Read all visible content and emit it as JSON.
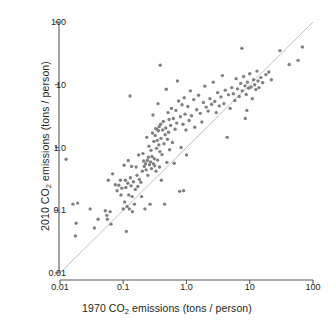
{
  "chart_data": {
    "type": "scatter",
    "title": "",
    "xlabel": "1970 CO2 emissions (tons / person)",
    "ylabel": "2010 CO2 emissions (tons / person)",
    "xlabel_parts": {
      "prefix": "1970 CO",
      "sub": "2",
      "suffix": " emissions (tons / person)"
    },
    "ylabel_parts": {
      "prefix": "2010 CO",
      "sub": "2",
      "suffix": " emissions (tons / person)"
    },
    "xscale": "log",
    "yscale": "log",
    "xlim": [
      0.01,
      100
    ],
    "ylim": [
      0.01,
      100
    ],
    "grid": false,
    "legend": null,
    "xticks": [
      "0.01",
      "0.1",
      "1.0",
      "10",
      "100"
    ],
    "xtick_values": [
      0.01,
      0.1,
      1.0,
      10,
      100
    ],
    "yticks": [
      "0.01",
      "0.1",
      "1.0",
      "10",
      "100"
    ],
    "ytick_values": [
      0.01,
      0.1,
      1.0,
      10,
      100
    ],
    "annotations": [
      {
        "name": "identity-line",
        "description": "y = x reference line",
        "from": [
          0.01,
          0.01
        ],
        "to": [
          100,
          100
        ],
        "color": "#b9b9b9"
      }
    ],
    "marker": {
      "shape": "circle",
      "color": "#808080",
      "size_px": 3.4
    },
    "point_count": 178,
    "points": [
      [
        0.0125,
        0.65
      ],
      [
        0.016,
        0.125
      ],
      [
        0.019,
        0.13
      ],
      [
        0.018,
        0.062
      ],
      [
        0.0175,
        0.039
      ],
      [
        0.03,
        0.105
      ],
      [
        0.035,
        0.052
      ],
      [
        0.04,
        0.072
      ],
      [
        0.052,
        0.098
      ],
      [
        0.055,
        0.083
      ],
      [
        0.056,
        0.072
      ],
      [
        0.058,
        0.3
      ],
      [
        0.062,
        0.095
      ],
      [
        0.064,
        0.06
      ],
      [
        0.068,
        0.38
      ],
      [
        0.075,
        0.255
      ],
      [
        0.08,
        0.205
      ],
      [
        0.085,
        0.25
      ],
      [
        0.09,
        0.3
      ],
      [
        0.092,
        0.175
      ],
      [
        0.095,
        0.225
      ],
      [
        0.1,
        0.105
      ],
      [
        0.103,
        0.52
      ],
      [
        0.105,
        0.135
      ],
      [
        0.108,
        0.3
      ],
      [
        0.11,
        0.23
      ],
      [
        0.112,
        0.046
      ],
      [
        0.115,
        0.115
      ],
      [
        0.118,
        0.27
      ],
      [
        0.12,
        0.62
      ],
      [
        0.122,
        0.175
      ],
      [
        0.125,
        0.105
      ],
      [
        0.128,
        6.6
      ],
      [
        0.13,
        0.33
      ],
      [
        0.133,
        0.245
      ],
      [
        0.135,
        0.5
      ],
      [
        0.138,
        0.165
      ],
      [
        0.14,
        0.095
      ],
      [
        0.145,
        0.285
      ],
      [
        0.15,
        0.125
      ],
      [
        0.155,
        0.215
      ],
      [
        0.16,
        0.49
      ],
      [
        0.165,
        0.36
      ],
      [
        0.17,
        0.24
      ],
      [
        0.175,
        0.76
      ],
      [
        0.18,
        0.31
      ],
      [
        0.19,
        0.28
      ],
      [
        0.195,
        0.165
      ],
      [
        0.2,
        0.42
      ],
      [
        0.205,
        0.8
      ],
      [
        0.21,
        0.61
      ],
      [
        0.215,
        0.5
      ],
      [
        0.22,
        0.105
      ],
      [
        0.225,
        0.55
      ],
      [
        0.23,
        0.44
      ],
      [
        0.235,
        1.45
      ],
      [
        0.24,
        0.62
      ],
      [
        0.245,
        0.36
      ],
      [
        0.25,
        0.7
      ],
      [
        0.255,
        1.05
      ],
      [
        0.26,
        0.53
      ],
      [
        0.265,
        0.125
      ],
      [
        0.27,
        0.59
      ],
      [
        0.275,
        0.9
      ],
      [
        0.28,
        0.46
      ],
      [
        0.285,
        0.72
      ],
      [
        0.29,
        1.7
      ],
      [
        0.295,
        3.3
      ],
      [
        0.3,
        0.55
      ],
      [
        0.305,
        1.25
      ],
      [
        0.31,
        0.66
      ],
      [
        0.315,
        0.51
      ],
      [
        0.32,
        1.55
      ],
      [
        0.325,
        2.0
      ],
      [
        0.33,
        0.42
      ],
      [
        0.335,
        0.97
      ],
      [
        0.34,
        1.95
      ],
      [
        0.345,
        1.3
      ],
      [
        0.35,
        0.63
      ],
      [
        0.355,
        5.0
      ],
      [
        0.36,
        1.85
      ],
      [
        0.365,
        1.1
      ],
      [
        0.37,
        2.15
      ],
      [
        0.375,
        0.49
      ],
      [
        0.38,
        0.86
      ],
      [
        0.385,
        20.5
      ],
      [
        0.39,
        2.35
      ],
      [
        0.395,
        1.4
      ],
      [
        0.4,
        0.3
      ],
      [
        0.41,
        0.77
      ],
      [
        0.42,
        1.9
      ],
      [
        0.43,
        2.6
      ],
      [
        0.44,
        1.15
      ],
      [
        0.45,
        0.125
      ],
      [
        0.46,
        1.6
      ],
      [
        0.47,
        2.05
      ],
      [
        0.48,
        8.5
      ],
      [
        0.49,
        0.58
      ],
      [
        0.5,
        1.35
      ],
      [
        0.51,
        3.6
      ],
      [
        0.52,
        1.75
      ],
      [
        0.53,
        2.8
      ],
      [
        0.54,
        0.92
      ],
      [
        0.56,
        2.25
      ],
      [
        0.58,
        4.2
      ],
      [
        0.6,
        1.2
      ],
      [
        0.62,
        2.9
      ],
      [
        0.64,
        0.56
      ],
      [
        0.66,
        1.95
      ],
      [
        0.68,
        3.9
      ],
      [
        0.7,
        2.45
      ],
      [
        0.72,
        11.5
      ],
      [
        0.75,
        5.5
      ],
      [
        0.78,
        0.2
      ],
      [
        0.8,
        3.1
      ],
      [
        0.82,
        1.0
      ],
      [
        0.85,
        4.8
      ],
      [
        0.88,
        2.35
      ],
      [
        0.9,
        0.205
      ],
      [
        0.92,
        6.2
      ],
      [
        0.95,
        3.4
      ],
      [
        0.98,
        1.9
      ],
      [
        1.0,
        0.76
      ],
      [
        1.05,
        4.5
      ],
      [
        1.1,
        2.7
      ],
      [
        1.15,
        8.0
      ],
      [
        1.2,
        3.2
      ],
      [
        1.3,
        5.8
      ],
      [
        1.35,
        2.1
      ],
      [
        1.45,
        4.0
      ],
      [
        1.55,
        6.8
      ],
      [
        1.65,
        3.5
      ],
      [
        1.75,
        2.55
      ],
      [
        1.85,
        5.2
      ],
      [
        1.95,
        9.5
      ],
      [
        2.05,
        4.4
      ],
      [
        2.2,
        3.8
      ],
      [
        2.35,
        6.0
      ],
      [
        2.5,
        4.9
      ],
      [
        2.65,
        11.0
      ],
      [
        2.8,
        5.4
      ],
      [
        2.95,
        3.6
      ],
      [
        3.1,
        7.5
      ],
      [
        3.3,
        4.6
      ],
      [
        3.5,
        6.4
      ],
      [
        3.7,
        14.0
      ],
      [
        3.9,
        5.0
      ],
      [
        4.1,
        8.2
      ],
      [
        4.4,
        1.45
      ],
      [
        4.6,
        6.9
      ],
      [
        4.9,
        4.2
      ],
      [
        5.2,
        9.0
      ],
      [
        5.5,
        7.2
      ],
      [
        5.8,
        5.6
      ],
      [
        6.1,
        12.5
      ],
      [
        6.4,
        8.6
      ],
      [
        6.8,
        6.5
      ],
      [
        7.2,
        10.5
      ],
      [
        7.6,
        8.0
      ],
      [
        8.0,
        13.5
      ],
      [
        8.4,
        9.6
      ],
      [
        8.8,
        7.0
      ],
      [
        9.2,
        11.0
      ],
      [
        9.6,
        8.8
      ],
      [
        10.0,
        15.0
      ],
      [
        10.5,
        9.2
      ],
      [
        11.0,
        6.0
      ],
      [
        11.5,
        12.0
      ],
      [
        12.0,
        10.0
      ],
      [
        12.5,
        8.4
      ],
      [
        13.0,
        16.5
      ],
      [
        13.5,
        11.5
      ],
      [
        14.0,
        9.0
      ],
      [
        15.0,
        13.0
      ],
      [
        16.0,
        10.8
      ],
      [
        7.5,
        38.0
      ],
      [
        8.5,
        2.9
      ],
      [
        9.0,
        3.9
      ],
      [
        18.0,
        14.5
      ],
      [
        20.0,
        16.0
      ],
      [
        22.0,
        12.0
      ],
      [
        30.0,
        35.0
      ],
      [
        42.0,
        21.0
      ],
      [
        58.0,
        24.5
      ],
      [
        68.0,
        40.0
      ]
    ]
  }
}
